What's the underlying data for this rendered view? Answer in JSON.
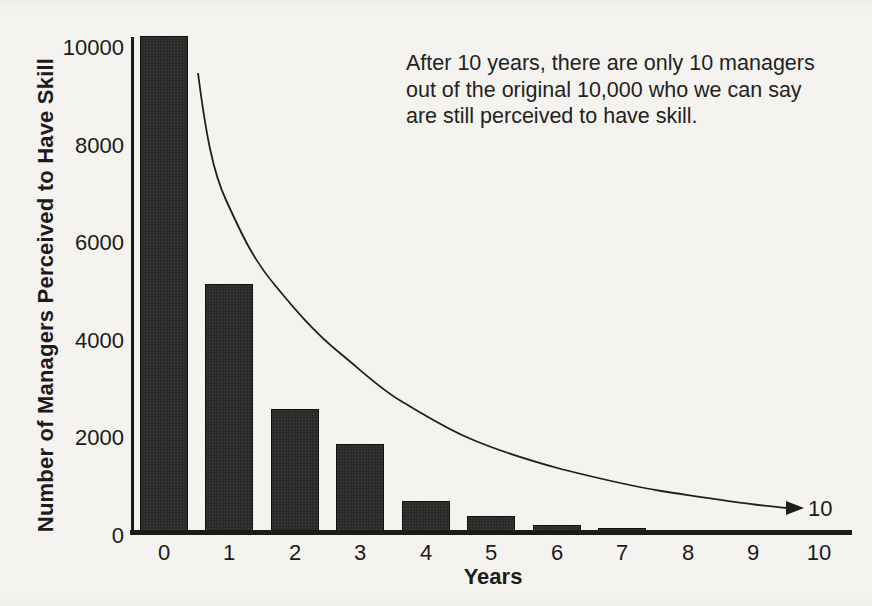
{
  "figure": {
    "background_color": "#f4f3f0",
    "ink_color": "#1d1c1a",
    "bar_color": "#2e2d2b"
  },
  "annotation": {
    "lines": [
      "After 10 years, there are only 10 managers",
      "out of the original 10,000 who we can say",
      "are still perceived to have skill."
    ]
  },
  "chart_data": {
    "type": "bar",
    "title": "",
    "xlabel": "Years",
    "ylabel": "Number of Managers Perceived to Have Skill",
    "categories": [
      "0",
      "1",
      "2",
      "3",
      "4",
      "5",
      "6",
      "7",
      "8",
      "9",
      "10"
    ],
    "values": [
      10000,
      5000,
      2500,
      1800,
      650,
      340,
      170,
      100,
      60,
      25,
      10
    ],
    "ylim": [
      0,
      10000
    ],
    "yticks": [
      0,
      2000,
      4000,
      6000,
      8000,
      10000
    ],
    "ytick_labels": [
      "0",
      "2000",
      "4000",
      "6000",
      "8000",
      "10000"
    ],
    "grid": false,
    "legend": null,
    "curve_end_label": "10"
  }
}
